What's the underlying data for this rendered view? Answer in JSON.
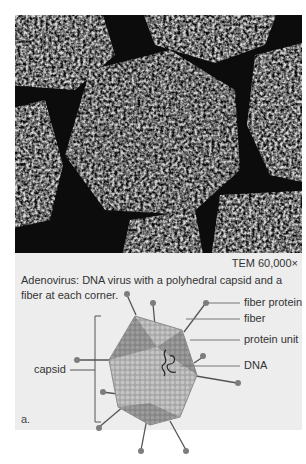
{
  "figure": {
    "magnification": "TEM 60,000×",
    "caption": "Adenovirus: DNA virus with a polyhedral capsid and a fiber at each corner.",
    "panel_label": "a.",
    "labels": {
      "fiber_protein": "fiber protein",
      "fiber": "fiber",
      "protein_unit": "protein unit",
      "dna": "DNA",
      "capsid": "capsid"
    },
    "colors": {
      "panel_bg": "#ededed",
      "page_bg": "#ffffff",
      "capsid_dark": "#8a8a8a",
      "capsid_light": "#b8b8b8",
      "fiber": "#555555",
      "text": "#333333"
    }
  }
}
